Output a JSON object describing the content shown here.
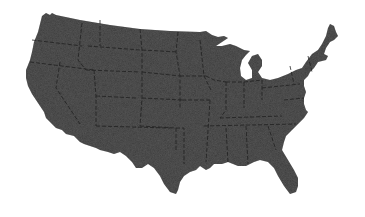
{
  "map": {
    "title": "",
    "region": "United States (contiguous)",
    "fill_color": "#3b3b3b",
    "border_color": "#1e1e1e",
    "background_color": "#ffffff",
    "labels": []
  }
}
